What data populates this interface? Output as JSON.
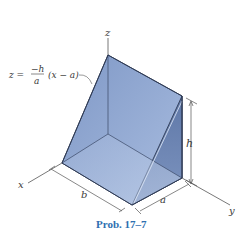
{
  "figure": {
    "caption": "Prob. 17–7",
    "equation": {
      "lhs": "z =",
      "numerator": "−h",
      "denominator": "a",
      "rhs": "(x − a)"
    },
    "axes": {
      "x": "x",
      "y": "y",
      "z": "z"
    },
    "dimensions": {
      "height": "h",
      "width": "a",
      "length": "b"
    },
    "colors": {
      "solid_top": "#8ea4cc",
      "solid_front": "#a9bcdc",
      "solid_side": "#6f86b3",
      "solid_bottom": "#9db0d4",
      "edge": "#2f3b55",
      "caption": "#2f6fb0"
    }
  }
}
